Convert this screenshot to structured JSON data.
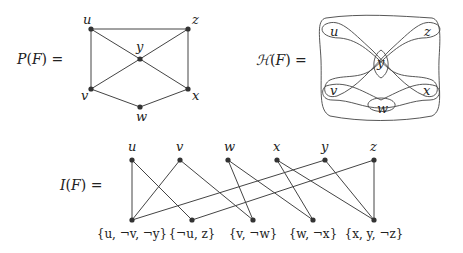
{
  "primal_graph": {
    "label": "P(F) =",
    "nodes": [
      {
        "id": "u",
        "x": 91,
        "y": 29,
        "lx": 83,
        "ly": 24
      },
      {
        "id": "z",
        "x": 188,
        "y": 29,
        "lx": 192,
        "ly": 24
      },
      {
        "id": "y",
        "x": 140,
        "y": 59,
        "lx": 136,
        "ly": 51
      },
      {
        "id": "v",
        "x": 91,
        "y": 89,
        "lx": 81,
        "ly": 100
      },
      {
        "id": "x",
        "x": 188,
        "y": 89,
        "lx": 192,
        "ly": 100
      },
      {
        "id": "w",
        "x": 140,
        "y": 107,
        "lx": 136,
        "ly": 121
      }
    ],
    "edges": [
      [
        "u",
        "z"
      ],
      [
        "u",
        "v"
      ],
      [
        "u",
        "y"
      ],
      [
        "z",
        "y"
      ],
      [
        "z",
        "x"
      ],
      [
        "y",
        "v"
      ],
      [
        "y",
        "x"
      ],
      [
        "v",
        "w"
      ],
      [
        "w",
        "x"
      ]
    ]
  },
  "hypergraph": {
    "label": "H(F) =",
    "vertices": [
      {
        "id": "u",
        "x": 334,
        "y": 33
      },
      {
        "id": "z",
        "x": 428,
        "y": 33
      },
      {
        "id": "y",
        "x": 381,
        "y": 64
      },
      {
        "id": "v",
        "x": 334,
        "y": 92
      },
      {
        "id": "x",
        "x": 427,
        "y": 92
      },
      {
        "id": "w",
        "x": 381,
        "y": 110
      }
    ],
    "hyperedges": [
      [
        "u",
        "v",
        "y"
      ],
      [
        "u",
        "z"
      ],
      [
        "v",
        "w"
      ],
      [
        "w",
        "x"
      ],
      [
        "x",
        "y",
        "z"
      ]
    ]
  },
  "incidence_graph": {
    "label": "I(F) =",
    "variables": [
      {
        "id": "u",
        "x": 132,
        "y": 160
      },
      {
        "id": "v",
        "x": 180,
        "y": 160
      },
      {
        "id": "w",
        "x": 228,
        "y": 160
      },
      {
        "id": "x",
        "x": 277,
        "y": 160
      },
      {
        "id": "y",
        "x": 325,
        "y": 160
      },
      {
        "id": "z",
        "x": 374,
        "y": 160
      }
    ],
    "clauses": [
      {
        "id": "c1",
        "label": "{u, ¬v, ¬y}",
        "x": 132,
        "y": 220
      },
      {
        "id": "c2",
        "label": "{¬u, z}",
        "x": 192,
        "y": 220
      },
      {
        "id": "c3",
        "label": "{v, ¬w}",
        "x": 253,
        "y": 220
      },
      {
        "id": "c4",
        "label": "{w, ¬x}",
        "x": 313,
        "y": 220
      },
      {
        "id": "c5",
        "label": "{x, y, ¬z}",
        "x": 374,
        "y": 220
      }
    ],
    "edges": [
      [
        "u",
        "c1"
      ],
      [
        "u",
        "c2"
      ],
      [
        "v",
        "c1"
      ],
      [
        "v",
        "c3"
      ],
      [
        "w",
        "c3"
      ],
      [
        "w",
        "c4"
      ],
      [
        "x",
        "c4"
      ],
      [
        "x",
        "c5"
      ],
      [
        "y",
        "c1"
      ],
      [
        "y",
        "c5"
      ],
      [
        "z",
        "c2"
      ],
      [
        "z",
        "c5"
      ]
    ]
  }
}
